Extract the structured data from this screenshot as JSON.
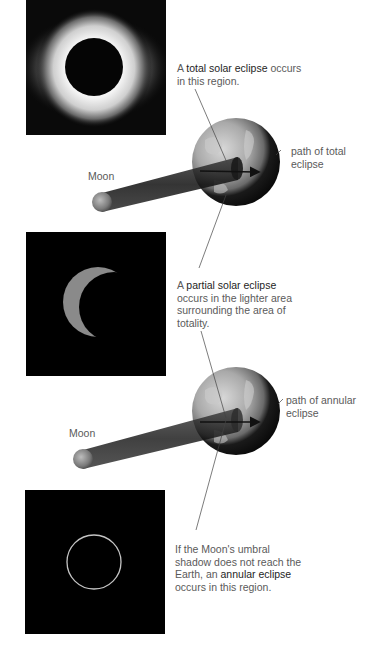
{
  "figure": {
    "total": {
      "photo_alt": "total-solar-eclipse-photo",
      "caption_pre": "A ",
      "caption_bold": "total solar eclipse",
      "caption_post": " occurs in this region.",
      "path_label_line1": "path of total",
      "path_label_line2": "eclipse",
      "moon_label": "Moon"
    },
    "partial": {
      "photo_alt": "partial-solar-eclipse-photo",
      "caption_pre": "A ",
      "caption_bold": "partial solar eclipse",
      "caption_post": " occurs in the lighter area surrounding the area of totality."
    },
    "annular": {
      "photo_alt": "annular-solar-eclipse-photo",
      "caption_pre": "If the Moon's umbral shadow does not reach the Earth, an ",
      "caption_bold": "annular eclipse",
      "caption_post": " occurs in this region.",
      "path_label_line1": "path of annular",
      "path_label_line2": "eclipse",
      "moon_label": "Moon"
    }
  },
  "colors": {
    "background": "#ffffff",
    "photo_bg": "#000000",
    "text": "#5a5a5a",
    "text_bold": "#1e1e1e",
    "corona": "#ffffff",
    "crescent": "#8a8a8a",
    "ring": "#bdbdbd",
    "earth_light": "#b9b9b9",
    "earth_dark": "#0d0d0d",
    "shadow": "#222222"
  }
}
